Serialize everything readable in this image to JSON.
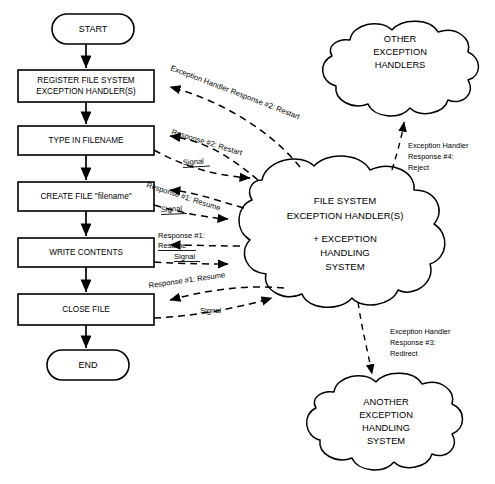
{
  "diagram": {
    "background": "#ffffff",
    "stroke_color": "#000000"
  },
  "flow_nodes": [
    {
      "id": "start",
      "type": "terminator",
      "label": "START"
    },
    {
      "id": "register",
      "type": "process",
      "label_line1": "REGISTER FILE SYSTEM",
      "label_line2": "EXCEPTION HANDLER(S)"
    },
    {
      "id": "typename",
      "type": "process",
      "label_line1": "TYPE IN FILENAME",
      "label_line2": ""
    },
    {
      "id": "createfile",
      "type": "process",
      "label_line1": "CREATE FILE \"filename\"",
      "label_line2": ""
    },
    {
      "id": "write",
      "type": "process",
      "label_line1": "WRITE CONTENTS",
      "label_line2": ""
    },
    {
      "id": "close",
      "type": "process",
      "label_line1": "CLOSE FILE",
      "label_line2": ""
    },
    {
      "id": "end",
      "type": "terminator",
      "label": "END"
    }
  ],
  "clouds": [
    {
      "id": "other-handlers",
      "lines": [
        "OTHER",
        "EXCEPTION",
        "HANDLERS"
      ]
    },
    {
      "id": "file-system-handler",
      "lines": [
        "FILE SYSTEM",
        "EXCEPTION HANDLER(S)"
      ],
      "lines2": [
        "+ EXCEPTION",
        "HANDLING",
        "SYSTEM"
      ]
    },
    {
      "id": "another-handling-system",
      "lines": [
        "ANOTHER",
        "EXCEPTION",
        "HANDLING",
        "SYSTEM"
      ]
    }
  ],
  "edge_labels": {
    "exception_handler_response_2_restart": "Exception Handler Response #2: Restart",
    "response_2_restart": "Response #2: Restart",
    "signal_1": "Signal",
    "response_1_resume_diag": "Response #1: Resume",
    "signal_2": "Signal",
    "response_1_line1": "Response #1:",
    "response_1_line2": "Resume",
    "signal_3": "Signal",
    "response_1_resume_diag_2": "Response #1: Resume",
    "signal_4": "Signal",
    "reject_line1": "Exception Handler",
    "reject_line2": "Response #4:",
    "reject_line3": "Reject",
    "redirect_line1": "Exception Handler",
    "redirect_line2": "Response #3:",
    "redirect_line3": "Redirect"
  }
}
